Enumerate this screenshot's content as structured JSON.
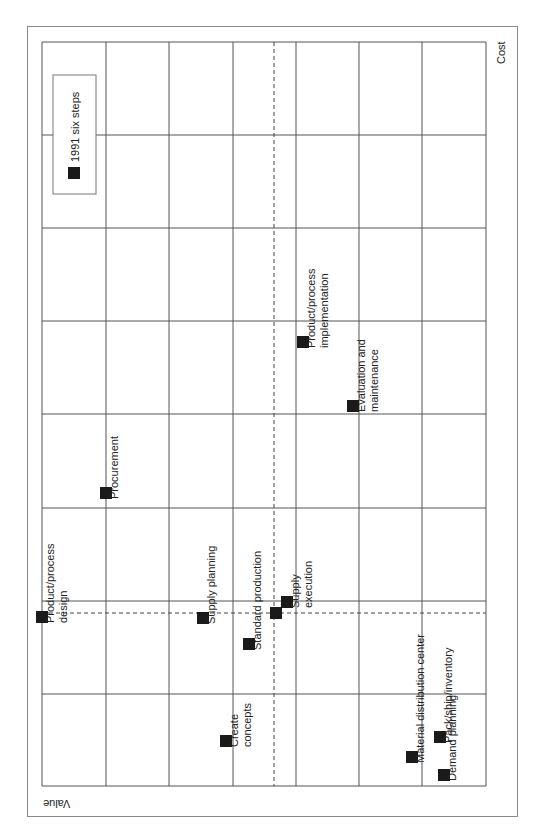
{
  "chart_data": {
    "type": "scatter",
    "orientation": "rotated-90-clockwise",
    "title": "",
    "xlabel": "Cost",
    "ylabel": "Value",
    "legend": {
      "position": "top-left",
      "entries": [
        "1991 six steps"
      ]
    },
    "grid": true,
    "grid_columns": 7,
    "grid_rows": 8,
    "reference_lines": {
      "dashed_vertical_x": 274,
      "dashed_horizontal_y": 613
    },
    "series": [
      {
        "name": "1991 six steps",
        "marker": "square",
        "color": "#1a1a1a",
        "points": [
          {
            "label": "Product/process design",
            "lines": [
              "Product/process",
              "design"
            ],
            "px": 42,
            "py": 617
          },
          {
            "label": "Procurement",
            "lines": [
              "Procurement"
            ],
            "px": 106,
            "py": 493
          },
          {
            "label": "Supply planning",
            "lines": [
              "Supply planning"
            ],
            "px": 203,
            "py": 618
          },
          {
            "label": "Create concepts",
            "lines": [
              "Create",
              "concepts"
            ],
            "px": 226,
            "py": 741
          },
          {
            "label": "Standard production",
            "lines": [
              "Standard production"
            ],
            "px": 249,
            "py": 644
          },
          {
            "label": "",
            "lines": [],
            "px": 276,
            "py": 613
          },
          {
            "label": "Supply execution",
            "lines": [
              "Supply",
              "execution"
            ],
            "px": 287,
            "py": 602
          },
          {
            "label": "Product/process implementation",
            "lines": [
              "Product/process",
              "implementation"
            ],
            "px": 303,
            "py": 342
          },
          {
            "label": "Evaluation and maintenance",
            "lines": [
              "Evaluation and",
              "maintenance"
            ],
            "px": 353,
            "py": 406
          },
          {
            "label": "Material distribution center",
            "lines": [
              "Material distribution center"
            ],
            "px": 412,
            "py": 757
          },
          {
            "label": "Pack/ship/inventory",
            "lines": [
              "Pack/ship/inventory"
            ],
            "px": 440,
            "py": 737
          },
          {
            "label": "Demand planning",
            "lines": [
              "Demand planning"
            ],
            "px": 444,
            "py": 775
          }
        ]
      }
    ]
  },
  "axes": {
    "cost_label": "Cost",
    "value_label": "Value"
  },
  "legend": {
    "label": "1991 six steps"
  },
  "colors": {
    "grid": "#555555",
    "frame": "#8a8a8a",
    "marker": "#1a1a1a"
  }
}
